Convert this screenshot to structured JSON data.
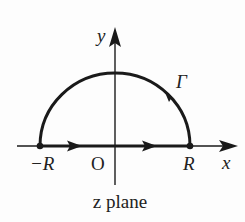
{
  "diagram": {
    "title": "z plane",
    "contour_name": "Γ",
    "axes": {
      "x_label": "x",
      "y_label": "y",
      "origin_label": "O"
    },
    "points": [
      {
        "name": "minus-R",
        "label": "−R",
        "value": "-R"
      },
      {
        "name": "plus-R",
        "label": "R",
        "value": "R"
      }
    ],
    "contour": {
      "description": "Closed semicircular contour in upper half-plane: segment from -R to R along real axis, then semicircular arc of radius R back to -R",
      "direction": "counterclockwise"
    },
    "colors": {
      "stroke": "#1a1a1a",
      "background": "#fdfdfd"
    }
  }
}
